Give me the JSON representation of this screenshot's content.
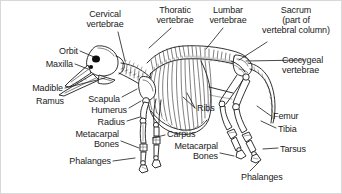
{
  "figure": {
    "background_color": "#ffffff",
    "line_color": "#1a1a1a",
    "text_color": "#1a1a1a",
    "width": 342,
    "height": 194
  },
  "labels": [
    {
      "id": "cervical-vertebrae",
      "text": "Cervical\nvertebrae",
      "x": 104,
      "y": 8,
      "align": "center"
    },
    {
      "id": "thoratic-vertebrae",
      "text": "Thoratic\nvertebrae",
      "x": 174,
      "y": 4,
      "align": "center"
    },
    {
      "id": "lumbar-vertebrae",
      "text": "Lumbar\nvertebrae",
      "x": 227,
      "y": 4,
      "align": "center"
    },
    {
      "id": "sacrum",
      "text": "Sacrum\n(part of\nvertebral column)",
      "x": 290,
      "y": 4,
      "align": "center"
    },
    {
      "id": "coccygeal-vertebrae",
      "text": "Coccygeal\nvertebrae",
      "x": 305,
      "y": 54,
      "align": "left"
    },
    {
      "id": "orbit",
      "text": "Orbit",
      "x": 77,
      "y": 47,
      "align": "right"
    },
    {
      "id": "maxilla",
      "text": "Maxilla",
      "x": 72,
      "y": 60,
      "align": "right"
    },
    {
      "id": "madible",
      "text": "Madible",
      "x": 62,
      "y": 84,
      "align": "right"
    },
    {
      "id": "ramus",
      "text": "Ramus",
      "x": 63,
      "y": 97,
      "align": "right"
    },
    {
      "id": "scapula",
      "text": "Scapula",
      "x": 119,
      "y": 95,
      "align": "right"
    },
    {
      "id": "humerus",
      "text": "Humerus",
      "x": 126,
      "y": 106,
      "align": "right"
    },
    {
      "id": "radius",
      "text": "Radius",
      "x": 124,
      "y": 119,
      "align": "right"
    },
    {
      "id": "metacarpal-bones-front",
      "text": "Metacarpal\nBones",
      "x": 118,
      "y": 131,
      "align": "right"
    },
    {
      "id": "phalanges-front",
      "text": "Phalanges",
      "x": 110,
      "y": 157,
      "align": "right"
    },
    {
      "id": "carpus",
      "text": "Carpus",
      "x": 166,
      "y": 131,
      "align": "left"
    },
    {
      "id": "metacarpal-bones-hind",
      "text": "Metacarpal\nBones",
      "x": 217,
      "y": 143,
      "align": "right"
    },
    {
      "id": "ribs",
      "text": "Ribs",
      "x": 196,
      "y": 105,
      "align": "left"
    },
    {
      "id": "femur",
      "text": "Femur",
      "x": 272,
      "y": 112,
      "align": "left"
    },
    {
      "id": "tibia",
      "text": "Tibia",
      "x": 277,
      "y": 125,
      "align": "left"
    },
    {
      "id": "tarsus",
      "text": "Tarsus",
      "x": 279,
      "y": 145,
      "align": "left"
    },
    {
      "id": "phalanges-hind",
      "text": "Phalanges",
      "x": 240,
      "y": 173,
      "align": "left"
    }
  ],
  "leader_lines": [
    {
      "id": "leader-cervical",
      "from": [
        117,
        31
      ],
      "to": [
        124,
        60
      ]
    },
    {
      "id": "leader-thoratic",
      "from": [
        170,
        27
      ],
      "to": [
        148,
        47
      ]
    },
    {
      "id": "leader-lumbar",
      "from": [
        222,
        27
      ],
      "to": [
        205,
        48
      ]
    },
    {
      "id": "leader-sacrum",
      "from": [
        266,
        41
      ],
      "to": [
        238,
        59
      ]
    },
    {
      "id": "leader-coccygeal",
      "from": [
        303,
        59
      ],
      "to": [
        245,
        60
      ]
    },
    {
      "id": "leader-orbit",
      "from": [
        79,
        50
      ],
      "to": [
        93,
        58
      ]
    },
    {
      "id": "leader-maxilla",
      "from": [
        74,
        63
      ],
      "to": [
        86,
        68
      ]
    },
    {
      "id": "leader-madible",
      "from": [
        64,
        87
      ],
      "to": [
        104,
        77
      ]
    },
    {
      "id": "leader-scapula",
      "from": [
        121,
        96
      ],
      "to": [
        136,
        88
      ]
    },
    {
      "id": "leader-humerus",
      "from": [
        128,
        107
      ],
      "to": [
        140,
        100
      ]
    },
    {
      "id": "leader-radius",
      "from": [
        126,
        120
      ],
      "to": [
        141,
        116
      ]
    },
    {
      "id": "leader-metacarpal-front",
      "from": [
        120,
        140
      ],
      "to": [
        139,
        146
      ]
    },
    {
      "id": "leader-phalanges-front",
      "from": [
        112,
        160
      ],
      "to": [
        133,
        156
      ]
    },
    {
      "id": "leader-carpus",
      "from": [
        164,
        134
      ],
      "to": [
        152,
        136
      ]
    },
    {
      "id": "leader-metacarpal-hind",
      "from": [
        219,
        152
      ],
      "to": [
        232,
        154
      ]
    },
    {
      "id": "leader-ribs",
      "from": [
        194,
        107
      ],
      "to": [
        182,
        96
      ]
    },
    {
      "id": "leader-femur",
      "from": [
        270,
        115
      ],
      "to": [
        256,
        105
      ]
    },
    {
      "id": "leader-tibia",
      "from": [
        275,
        127
      ],
      "to": [
        262,
        120
      ]
    },
    {
      "id": "leader-tarsus",
      "from": [
        277,
        147
      ],
      "to": [
        264,
        148
      ]
    },
    {
      "id": "leader-phalanges-hind",
      "from": [
        249,
        170
      ],
      "to": [
        258,
        160
      ]
    }
  ]
}
